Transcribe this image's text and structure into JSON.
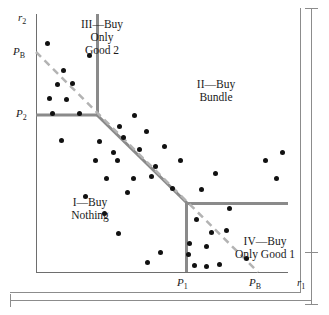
{
  "figure": {
    "type": "scatter-region-diagram"
  },
  "axes": {
    "y_axis_label": "r₂",
    "x_axis_label": "r₁",
    "y_ticks": [
      {
        "id": "pb-y",
        "label": "P",
        "sub": "B",
        "y": 52
      },
      {
        "id": "p2",
        "label": "P",
        "sub": "2",
        "y": 115
      }
    ],
    "x_ticks": [
      {
        "id": "p1",
        "label": "P",
        "sub": "1",
        "x": 186
      },
      {
        "id": "pb-x",
        "label": "P",
        "sub": "B",
        "x": 258
      }
    ],
    "origin": {
      "x": 36,
      "y": 272
    },
    "x_range_px": [
      36,
      288
    ],
    "y_range_px": [
      14,
      272
    ]
  },
  "labels": {
    "region_1": "I—Buy\nNothing",
    "region_2": "II—Buy\nBundle",
    "region_3": "III—Buy\nOnly\nGood 2",
    "region_4": "IV—Buy\nOnly Good 1",
    "y_axis": "r",
    "y_axis_sub": "2",
    "x_axis": "r",
    "x_axis_sub": "1",
    "tick_pb": "P",
    "tick_pb_sub": "B",
    "tick_p2": "P",
    "tick_p2_sub": "2",
    "tick_p1": "P",
    "tick_p1_sub": "1"
  },
  "colors": {
    "boundary": "#8a8a8a",
    "dashed": "#b0b0b0",
    "axis": "#6e6e6e",
    "point": "#111111",
    "frame": "#8c8c8c",
    "background": "#ffffff"
  },
  "geometry": {
    "boundary_polyline": [
      [
        36,
        115
      ],
      [
        97,
        115
      ],
      [
        97,
        14
      ],
      [
        97,
        115
      ],
      [
        186,
        203
      ],
      [
        186,
        272
      ],
      [
        186,
        203
      ],
      [
        288,
        203
      ]
    ],
    "boundary_segments": [
      {
        "name": "p2-horizontal",
        "from": [
          36,
          115
        ],
        "to": [
          97,
          115
        ]
      },
      {
        "name": "region3-vertical",
        "from": [
          97,
          115
        ],
        "to": [
          97,
          14
        ]
      },
      {
        "name": "bundle-diagonal",
        "from": [
          97,
          115
        ],
        "to": [
          186,
          203
        ]
      },
      {
        "name": "p1-vertical",
        "from": [
          186,
          203
        ],
        "to": [
          186,
          272
        ]
      },
      {
        "name": "region4-horizontal",
        "from": [
          186,
          203
        ],
        "to": [
          288,
          203
        ]
      }
    ],
    "dashed_line": {
      "from": [
        36,
        52
      ],
      "to": [
        258,
        272
      ]
    },
    "boundary_width": 3,
    "dashed_width": 2.5
  },
  "chart_data": {
    "type": "scatter",
    "title": "",
    "xlabel": "r₁",
    "ylabel": "r₂",
    "series": [
      {
        "name": "consumers",
        "points_px": [
          [
            52,
            113
          ],
          [
            49,
            98
          ],
          [
            47,
            43
          ],
          [
            63,
            70
          ],
          [
            57,
            84
          ],
          [
            66,
            99
          ],
          [
            72,
            83
          ],
          [
            79,
            113
          ],
          [
            61,
            140
          ],
          [
            89,
            55
          ],
          [
            99,
            141
          ],
          [
            119,
            126
          ],
          [
            113,
            152
          ],
          [
            134,
            115
          ],
          [
            123,
            137
          ],
          [
            146,
            131
          ],
          [
            117,
            160
          ],
          [
            139,
            149
          ],
          [
            164,
            146
          ],
          [
            155,
            166
          ],
          [
            106,
            178
          ],
          [
            133,
            178
          ],
          [
            127,
            192
          ],
          [
            151,
            176
          ],
          [
            180,
            160
          ],
          [
            172,
            188
          ],
          [
            95,
            160
          ],
          [
            85,
            196
          ],
          [
            104,
            213
          ],
          [
            118,
            233
          ],
          [
            201,
            189
          ],
          [
            215,
            173
          ],
          [
            196,
            219
          ],
          [
            226,
            230
          ],
          [
            189,
            243
          ],
          [
            188,
            254
          ],
          [
            194,
            265
          ],
          [
            206,
            266
          ],
          [
            219,
            264
          ],
          [
            206,
            246
          ],
          [
            211,
            232
          ],
          [
            246,
            258
          ],
          [
            229,
            208
          ],
          [
            265,
            160
          ],
          [
            282,
            152
          ],
          [
            276,
            178
          ],
          [
            160,
            252
          ],
          [
            147,
            262
          ]
        ]
      }
    ],
    "regions": [
      {
        "id": "I",
        "label": "I—Buy Nothing",
        "center_px": [
          90,
          206
        ]
      },
      {
        "id": "II",
        "label": "II—Buy Bundle",
        "center_px": [
          216,
          88
        ]
      },
      {
        "id": "III",
        "label": "III—Buy Only Good 2",
        "center_px": [
          100,
          40
        ]
      },
      {
        "id": "IV",
        "label": "IV—Buy Only Good 1",
        "center_px": [
          265,
          245
        ]
      }
    ],
    "grid": false,
    "legend": "none"
  }
}
